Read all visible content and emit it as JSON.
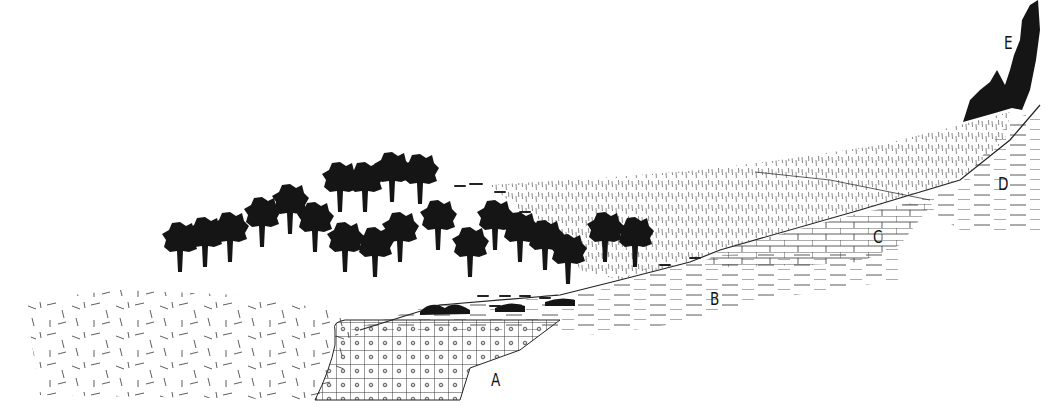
{
  "diagram": {
    "type": "geological-cross-section",
    "colors": {
      "ink": "#111111",
      "background": "#ffffff",
      "hatch": "#444444"
    },
    "labels": [
      {
        "id": "A",
        "text": "A",
        "x": 491,
        "y": 372,
        "stratum": "gridded-limestone-with-dots"
      },
      {
        "id": "B",
        "text": "B",
        "x": 710,
        "y": 291,
        "stratum": "dashed-shale"
      },
      {
        "id": "C",
        "text": "C",
        "x": 873,
        "y": 229,
        "stratum": "brick-limestone"
      },
      {
        "id": "D",
        "text": "D",
        "x": 998,
        "y": 176,
        "stratum": "dashed-shale-upper"
      },
      {
        "id": "E",
        "text": "E",
        "x": 1004,
        "y": 35,
        "stratum": "black-cliff-cap"
      }
    ]
  }
}
